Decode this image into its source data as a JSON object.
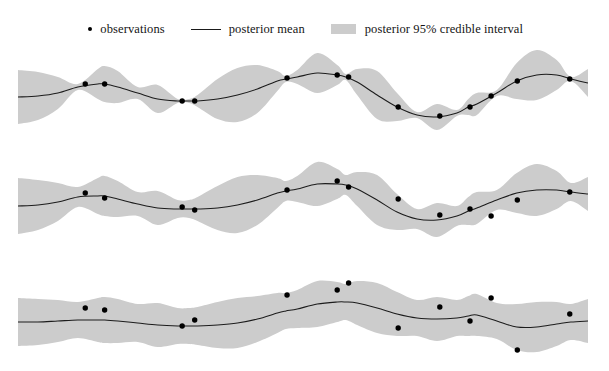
{
  "figure": {
    "title": "",
    "background_color": "#ffffff",
    "width": 609,
    "height": 371
  },
  "legend": {
    "position": "top-center",
    "entries": [
      {
        "marker": "dot-marker-icon",
        "label": "observations",
        "color": "#000000"
      },
      {
        "marker": "line-marker-icon",
        "label": "posterior mean",
        "color": "#1a1a1a"
      },
      {
        "marker": "band-swatch-icon",
        "label": "posterior 95% credible interval",
        "color": "#cccccc"
      }
    ]
  },
  "chart_data": {
    "type": "line",
    "title": "",
    "xlabel": "",
    "ylabel": "",
    "grid": false,
    "legend_position": "top-center",
    "axis_visible": false,
    "xlim": [
      0,
      1
    ],
    "plot_x_start_px": 18,
    "plot_x_end_px": 588,
    "colors": {
      "mean_line": "#1c1c1c",
      "credible_band": "#cccccc",
      "observations": "#000000",
      "background": "#ffffff"
    },
    "panels": [
      {
        "name": "panel-1",
        "description": "short lengthscale, low noise: band pinches to zero at observations",
        "top_px": 12,
        "height_px": 85,
        "baseline_px": 48,
        "y_scale_px": 1.0,
        "noise_sd": 0.6,
        "lengthscale": 0.055,
        "prior_sd": 28,
        "mean": {
          "x": [
            0.0,
            0.035,
            0.07,
            0.105,
            0.14,
            0.152,
            0.175,
            0.21,
            0.245,
            0.28,
            0.3,
            0.315,
            0.35,
            0.385,
            0.42,
            0.455,
            0.47,
            0.49,
            0.525,
            0.56,
            0.575,
            0.595,
            0.63,
            0.665,
            0.7,
            0.735,
            0.77,
            0.79,
            0.805,
            0.84,
            0.875,
            0.91,
            0.945,
            0.97,
            1.0
          ],
          "y": [
            40,
            41,
            44,
            50,
            53,
            53,
            50,
            44,
            38,
            36,
            36,
            36,
            38,
            42,
            48,
            56,
            58,
            60,
            64,
            62,
            60,
            55,
            42,
            30,
            22,
            20,
            24,
            30,
            33,
            44,
            56,
            62,
            62,
            58,
            54
          ]
        },
        "band_halfwidth": {
          "x": [
            0.0,
            0.035,
            0.07,
            0.105,
            0.14,
            0.152,
            0.175,
            0.21,
            0.245,
            0.28,
            0.3,
            0.315,
            0.35,
            0.385,
            0.42,
            0.455,
            0.47,
            0.49,
            0.525,
            0.56,
            0.575,
            0.595,
            0.63,
            0.665,
            0.7,
            0.735,
            0.77,
            0.79,
            0.805,
            0.84,
            0.875,
            0.91,
            0.945,
            0.97,
            1.0
          ],
          "y": [
            27,
            24,
            16,
            3,
            15,
            18,
            16,
            6,
            14,
            2,
            2,
            6,
            20,
            27,
            24,
            10,
            3,
            7,
            20,
            10,
            3,
            13,
            24,
            14,
            3,
            13,
            3,
            8,
            11,
            3,
            18,
            25,
            15,
            2,
            14
          ]
        },
        "observations": [
          {
            "x": 0.118,
            "y": 53
          },
          {
            "x": 0.152,
            "y": 53
          },
          {
            "x": 0.288,
            "y": 36
          },
          {
            "x": 0.31,
            "y": 36
          },
          {
            "x": 0.472,
            "y": 59
          },
          {
            "x": 0.56,
            "y": 62
          },
          {
            "x": 0.58,
            "y": 60
          },
          {
            "x": 0.667,
            "y": 30
          },
          {
            "x": 0.74,
            "y": 21
          },
          {
            "x": 0.793,
            "y": 30
          },
          {
            "x": 0.83,
            "y": 41
          },
          {
            "x": 0.876,
            "y": 56
          },
          {
            "x": 0.968,
            "y": 58
          }
        ]
      },
      {
        "name": "panel-2",
        "description": "medium lengthscale, moderate noise: band narrows but does not vanish at observations",
        "top_px": 115,
        "height_px": 95,
        "baseline_px": 52,
        "y_scale_px": 1.0,
        "noise_sd": 4.0,
        "lengthscale": 0.075,
        "prior_sd": 30,
        "mean": {
          "x": [
            0.0,
            0.035,
            0.07,
            0.105,
            0.14,
            0.152,
            0.175,
            0.21,
            0.245,
            0.28,
            0.3,
            0.315,
            0.35,
            0.385,
            0.42,
            0.455,
            0.47,
            0.49,
            0.525,
            0.56,
            0.575,
            0.595,
            0.63,
            0.665,
            0.7,
            0.735,
            0.77,
            0.79,
            0.805,
            0.84,
            0.875,
            0.91,
            0.945,
            0.97,
            1.0
          ],
          "y": [
            44,
            45,
            48,
            53,
            54,
            54,
            51,
            46,
            42,
            41,
            41,
            41,
            42,
            45,
            50,
            57,
            59,
            61,
            66,
            66,
            65,
            61,
            50,
            38,
            31,
            30,
            34,
            39,
            42,
            50,
            57,
            60,
            60,
            58,
            56
          ]
        },
        "band_halfwidth": {
          "x": [
            0.0,
            0.035,
            0.07,
            0.105,
            0.14,
            0.152,
            0.175,
            0.21,
            0.245,
            0.28,
            0.3,
            0.315,
            0.35,
            0.385,
            0.42,
            0.455,
            0.47,
            0.49,
            0.525,
            0.56,
            0.575,
            0.595,
            0.63,
            0.665,
            0.7,
            0.735,
            0.77,
            0.79,
            0.805,
            0.84,
            0.875,
            0.91,
            0.945,
            0.97,
            1.0
          ],
          "y": [
            28,
            25,
            19,
            10,
            18,
            20,
            18,
            12,
            17,
            9,
            9,
            12,
            22,
            28,
            25,
            15,
            10,
            13,
            22,
            15,
            10,
            17,
            25,
            18,
            10,
            17,
            10,
            14,
            16,
            10,
            20,
            26,
            19,
            9,
            17
          ]
        },
        "observations": [
          {
            "x": 0.118,
            "y": 57
          },
          {
            "x": 0.152,
            "y": 52
          },
          {
            "x": 0.288,
            "y": 43
          },
          {
            "x": 0.31,
            "y": 40
          },
          {
            "x": 0.472,
            "y": 60
          },
          {
            "x": 0.56,
            "y": 69
          },
          {
            "x": 0.58,
            "y": 63
          },
          {
            "x": 0.667,
            "y": 51
          },
          {
            "x": 0.74,
            "y": 35
          },
          {
            "x": 0.793,
            "y": 41
          },
          {
            "x": 0.83,
            "y": 34
          },
          {
            "x": 0.876,
            "y": 50
          },
          {
            "x": 0.968,
            "y": 58
          }
        ]
      },
      {
        "name": "panel-3",
        "description": "long lengthscale, high noise: nearly constant-width band, observations scattered off the mean",
        "top_px": 225,
        "height_px": 105,
        "baseline_px": 56,
        "y_scale_px": 1.0,
        "noise_sd": 9.0,
        "lengthscale": 0.12,
        "prior_sd": 32,
        "mean": {
          "x": [
            0.0,
            0.035,
            0.07,
            0.105,
            0.14,
            0.152,
            0.175,
            0.21,
            0.245,
            0.28,
            0.3,
            0.315,
            0.35,
            0.385,
            0.42,
            0.455,
            0.47,
            0.49,
            0.525,
            0.56,
            0.575,
            0.595,
            0.63,
            0.665,
            0.7,
            0.735,
            0.77,
            0.79,
            0.805,
            0.84,
            0.875,
            0.91,
            0.945,
            0.97,
            1.0
          ],
          "y": [
            48,
            48,
            49,
            50,
            50,
            50,
            49,
            47,
            45,
            44,
            44,
            44,
            45,
            47,
            51,
            57,
            59,
            61,
            66,
            68,
            68,
            67,
            62,
            56,
            52,
            51,
            52,
            54,
            55,
            49,
            43,
            43,
            46,
            48,
            49
          ]
        },
        "band_halfwidth": {
          "x": [
            0.0,
            0.035,
            0.07,
            0.105,
            0.14,
            0.152,
            0.175,
            0.21,
            0.245,
            0.28,
            0.3,
            0.315,
            0.35,
            0.385,
            0.42,
            0.455,
            0.47,
            0.49,
            0.525,
            0.56,
            0.575,
            0.595,
            0.63,
            0.665,
            0.7,
            0.735,
            0.77,
            0.79,
            0.805,
            0.84,
            0.875,
            0.91,
            0.945,
            0.97,
            1.0
          ],
          "y": [
            24,
            23,
            21,
            18,
            22,
            23,
            22,
            19,
            22,
            18,
            18,
            19,
            23,
            25,
            23,
            20,
            18,
            19,
            23,
            20,
            18,
            22,
            25,
            22,
            18,
            22,
            18,
            20,
            21,
            18,
            23,
            25,
            22,
            18,
            22
          ]
        },
        "observations": [
          {
            "x": 0.118,
            "y": 62
          },
          {
            "x": 0.152,
            "y": 60
          },
          {
            "x": 0.288,
            "y": 44
          },
          {
            "x": 0.31,
            "y": 50
          },
          {
            "x": 0.472,
            "y": 75
          },
          {
            "x": 0.56,
            "y": 80
          },
          {
            "x": 0.58,
            "y": 87
          },
          {
            "x": 0.667,
            "y": 42
          },
          {
            "x": 0.74,
            "y": 63
          },
          {
            "x": 0.793,
            "y": 49
          },
          {
            "x": 0.83,
            "y": 72
          },
          {
            "x": 0.876,
            "y": 20
          },
          {
            "x": 0.968,
            "y": 56
          }
        ]
      }
    ]
  }
}
